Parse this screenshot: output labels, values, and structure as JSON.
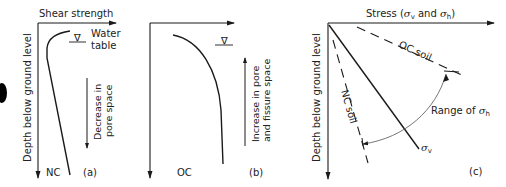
{
  "panel_a": {
    "x_axis_label": "Shear strength",
    "y_axis_label": "Depth below ground level",
    "water_table_label_line1": "Water",
    "water_table_label_line2": "table",
    "water_table_symbol": "∇",
    "arrow_label_line1": "Decrease in",
    "arrow_label_line2": "pore space",
    "curve_label": "NC",
    "panel_tag": "(a)"
  },
  "panel_b": {
    "water_table_symbol": "∇",
    "arrow_label_line1": "Increase in pore",
    "arrow_label_line2": "and fissure space",
    "curve_label": "OC",
    "panel_tag": "(b)"
  },
  "panel_c": {
    "x_axis_label_prefix": "Stress (",
    "sigma": "σ",
    "sub_v": "v",
    "sub_h": "h",
    "and": " and ",
    "close": ")",
    "y_axis_label": "Depth below ground level",
    "oc_line_label": "OC soil",
    "nc_line_label": "NC soil",
    "range_label": "Range of ",
    "panel_tag": "(c)"
  },
  "colors": {
    "line": "#1a1a1a",
    "arc": "#666666",
    "blob": "#000000"
  }
}
